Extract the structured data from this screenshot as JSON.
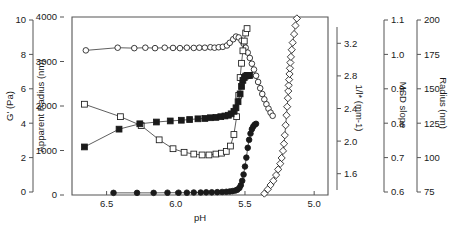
{
  "chart_data": {
    "type": "scatter",
    "title": "",
    "subtitle": "",
    "xlabel": "pH",
    "xlim": [
      6.75,
      4.9
    ],
    "x_reversed": true,
    "x_ticks": [
      6.5,
      6.0,
      5.5,
      5.0
    ],
    "x_tick_labels": [
      "6.5",
      "6.0",
      "5.5",
      "5.0"
    ],
    "grid": false,
    "legend": "none",
    "axes": [
      {
        "id": "g-prime",
        "label": "G' (Pa)",
        "unit": "Pa",
        "position": "left-outer-1",
        "lim": [
          0,
          10
        ],
        "ticks": [
          0,
          2,
          4,
          6,
          8,
          10
        ],
        "tick_labels": [
          "0",
          "2",
          "4",
          "6",
          "8",
          "10"
        ]
      },
      {
        "id": "apparent-radius",
        "label": "Apparent Radius (nm)",
        "unit": "nm",
        "position": "left-outer-2",
        "lim": [
          0,
          4000
        ],
        "ticks": [
          0,
          1000,
          2000,
          3000,
          4000
        ],
        "tick_labels": [
          "0",
          "1000",
          "2000",
          "3000",
          "4000"
        ]
      },
      {
        "id": "inverse-lstar",
        "label": "1/l* (mm-1)",
        "unit": "mm-1",
        "position": "right-outer-1",
        "lim": [
          1.4,
          3.4
        ],
        "ticks": [
          1.6,
          2.0,
          2.4,
          2.8,
          3.2
        ],
        "tick_labels": [
          "1.6",
          "2.0",
          "2.4",
          "2.8",
          "3.2"
        ]
      },
      {
        "id": "msd-slope",
        "label": "MSD slope",
        "unit": "",
        "position": "right-outer-2",
        "lim": [
          0.6,
          1.1
        ],
        "ticks": [
          0.6,
          0.7,
          0.8,
          0.9,
          1.0,
          1.1
        ],
        "tick_labels": [
          "0.6",
          "0.7",
          "0.8",
          "0.9",
          "1.0",
          "1.1"
        ]
      },
      {
        "id": "radius",
        "label": "Radius (nm)",
        "unit": "nm",
        "position": "right-outer-3",
        "lim": [
          75,
          200
        ],
        "ticks": [
          75,
          100,
          125,
          150,
          175,
          200
        ],
        "tick_labels": [
          "75",
          "100",
          "125",
          "150",
          "175",
          "200"
        ]
      }
    ],
    "series": [
      {
        "name": "Apparent Radius (open circles)",
        "marker": "open-circle",
        "axis": "apparent-radius",
        "x": [
          6.65,
          6.42,
          6.3,
          6.22,
          6.15,
          6.08,
          6.02,
          5.97,
          5.92,
          5.87,
          5.83,
          5.79,
          5.75,
          5.72,
          5.69,
          5.66,
          5.63,
          5.61,
          5.585,
          5.565,
          5.545,
          5.525,
          5.51,
          5.495,
          5.48,
          5.465,
          5.45,
          5.435,
          5.42,
          5.405,
          5.39,
          5.375,
          5.36,
          5.345,
          5.33,
          5.315,
          5.3
        ],
        "y": [
          3250,
          3310,
          3300,
          3310,
          3300,
          3310,
          3305,
          3300,
          3310,
          3305,
          3310,
          3310,
          3320,
          3310,
          3320,
          3330,
          3360,
          3420,
          3500,
          3560,
          3540,
          3470,
          3400,
          3310,
          3200,
          3080,
          2950,
          2820,
          2680,
          2540,
          2400,
          2270,
          2150,
          2040,
          1940,
          1850,
          1780
        ]
      },
      {
        "name": "1/l* (open squares)",
        "marker": "open-square",
        "axis": "inverse-lstar",
        "x": [
          6.66,
          6.4,
          6.25,
          6.12,
          6.02,
          5.94,
          5.87,
          5.81,
          5.76,
          5.71,
          5.67,
          5.635,
          5.605,
          5.58,
          5.56,
          5.545,
          5.535,
          5.525,
          5.515,
          5.505,
          5.495,
          5.485
        ],
        "y": [
          2.42,
          2.28,
          2.18,
          2.02,
          1.92,
          1.88,
          1.86,
          1.85,
          1.85,
          1.86,
          1.87,
          1.89,
          1.95,
          2.08,
          2.28,
          2.52,
          2.72,
          2.88,
          3.02,
          3.13,
          3.22,
          3.27
        ]
      },
      {
        "name": "MSD slope (filled squares)",
        "marker": "filled-square",
        "axis": "msd-slope",
        "x": [
          6.66,
          6.41,
          6.26,
          6.14,
          6.04,
          5.96,
          5.9,
          5.84,
          5.79,
          5.75,
          5.71,
          5.675,
          5.645,
          5.62,
          5.6,
          5.58,
          5.565,
          5.55,
          5.535,
          5.525,
          5.515,
          5.505,
          5.495,
          5.485,
          5.475,
          5.465
        ],
        "y": [
          0.735,
          0.785,
          0.8,
          0.805,
          0.808,
          0.81,
          0.812,
          0.814,
          0.815,
          0.817,
          0.818,
          0.82,
          0.822,
          0.824,
          0.828,
          0.835,
          0.845,
          0.862,
          0.884,
          0.905,
          0.922,
          0.93,
          0.934,
          0.936,
          0.936,
          0.936
        ]
      },
      {
        "name": "G' (filled circles)",
        "marker": "filled-circle",
        "axis": "g-prime",
        "x": [
          6.45,
          6.28,
          6.16,
          6.06,
          5.98,
          5.92,
          5.87,
          5.82,
          5.78,
          5.74,
          5.7,
          5.665,
          5.635,
          5.61,
          5.59,
          5.57,
          5.555,
          5.54,
          5.53,
          5.52,
          5.51,
          5.5,
          5.49,
          5.48,
          5.47,
          5.46,
          5.45,
          5.44,
          5.43,
          5.42
        ],
        "y": [
          0.12,
          0.12,
          0.12,
          0.13,
          0.13,
          0.13,
          0.14,
          0.14,
          0.15,
          0.15,
          0.16,
          0.17,
          0.18,
          0.2,
          0.22,
          0.25,
          0.3,
          0.4,
          0.55,
          0.8,
          1.15,
          1.6,
          2.1,
          2.65,
          3.1,
          3.45,
          3.7,
          3.85,
          3.95,
          4.0
        ]
      },
      {
        "name": "Radius (open diamonds)",
        "marker": "open-diamond",
        "axis": "radius",
        "x": [
          5.36,
          5.335,
          5.315,
          5.295,
          5.275,
          5.26,
          5.245,
          5.235,
          5.225,
          5.218,
          5.212,
          5.206,
          5.2,
          5.195,
          5.19,
          5.187,
          5.184,
          5.181,
          5.178,
          5.175,
          5.172,
          5.168,
          5.162,
          5.155,
          5.145,
          5.135,
          5.125
        ],
        "y": [
          76,
          79,
          82,
          85,
          89,
          93,
          97,
          101,
          106,
          111,
          117,
          124,
          131,
          137,
          143,
          148,
          152,
          156,
          160,
          164,
          168,
          172,
          177,
          182,
          188,
          194,
          199
        ]
      }
    ]
  },
  "colors": {
    "axis": "#555555",
    "marker_stroke": "#1a1a1a",
    "marker_fill": "#1a1a1a",
    "background": "#ffffff"
  }
}
